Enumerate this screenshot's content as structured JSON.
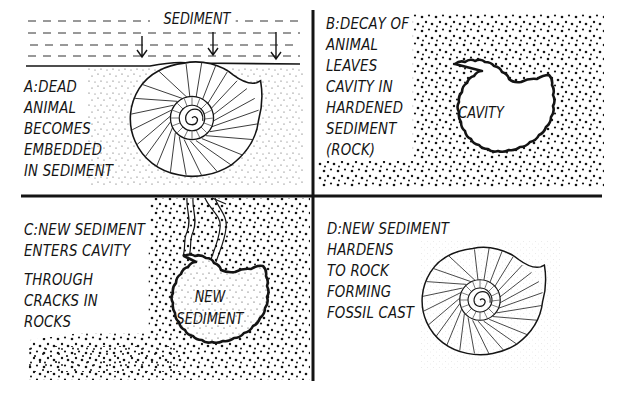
{
  "diagram": {
    "topic": "Formation of a fossil cast",
    "colors": {
      "ink": "#141414",
      "background": "#ffffff"
    },
    "panels": [
      {
        "id": "A",
        "lines": [
          "A:DEAD",
          "ANIMAL",
          "BECOMES",
          "EMBEDDED",
          "IN SEDIMENT"
        ],
        "overlay_label": "SEDIMENT",
        "illustration": "ammonite-shell-embedded-in-sediment",
        "arrows": 3
      },
      {
        "id": "B",
        "lines": [
          "B:DECAY OF",
          "ANIMAL",
          "LEAVES",
          "CAVITY IN",
          "HARDENED",
          "SEDIMENT",
          "(ROCK)"
        ],
        "inner_label": "CAVITY",
        "illustration": "shell-shaped-cavity-in-rock"
      },
      {
        "id": "C",
        "lines": [
          "C:NEW SEDIMENT",
          "ENTERS CAVITY",
          "THROUGH",
          "CRACKS IN",
          "ROCKS"
        ],
        "inner_label_lines": [
          "NEW",
          "SEDIMENT"
        ],
        "illustration": "cavity-filled-via-cracks"
      },
      {
        "id": "D",
        "lines": [
          "D:NEW SEDIMENT",
          "HARDENS",
          "TO ROCK",
          "FORMING",
          "FOSSIL CAST"
        ],
        "illustration": "ammonite-fossil-cast"
      }
    ]
  }
}
